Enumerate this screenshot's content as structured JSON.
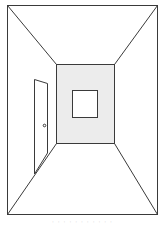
{
  "figure": {
    "colors": {
      "line": "#3a3a3a",
      "back_wall_fill": "#ececec",
      "background": "#ffffff",
      "caption": "#c8c8c8"
    },
    "elements": [
      "outer-frame",
      "back-wall",
      "window",
      "door",
      "door-knob",
      "vanishing-lines"
    ]
  },
  "caption": {
    "text": "· · · · ·  · · · · · ·"
  }
}
